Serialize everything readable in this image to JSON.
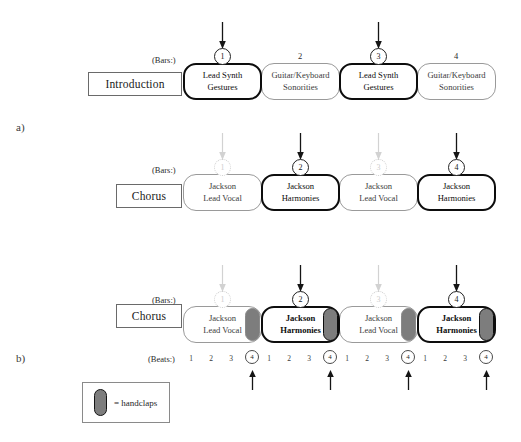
{
  "figure": {
    "sections": [
      {
        "letter": "a)",
        "rows": [
          {
            "name": "Introduction",
            "bars_label": "(Bars:)",
            "bars": [
              {
                "number": "1",
                "circled": true,
                "accent": true,
                "arrow": "black",
                "text": [
                  "Lead Synth",
                  "Gestures"
                ],
                "emphasis": "thick"
              },
              {
                "number": "2",
                "circled": false,
                "accent": false,
                "arrow": "none",
                "text": [
                  "Guitar/Keyboard",
                  "Sonorities"
                ],
                "emphasis": "thin"
              },
              {
                "number": "3",
                "circled": true,
                "accent": true,
                "arrow": "black",
                "text": [
                  "Lead Synth",
                  "Gestures"
                ],
                "emphasis": "thick"
              },
              {
                "number": "4",
                "circled": false,
                "accent": false,
                "arrow": "none",
                "text": [
                  "Guitar/Keyboard",
                  "Sonorities"
                ],
                "emphasis": "thin"
              }
            ]
          },
          {
            "name": "Chorus",
            "bars_label": "(Bars:)",
            "bars": [
              {
                "number": "1",
                "circled": false,
                "accent": false,
                "arrow": "gray",
                "text": [
                  "Jackson",
                  "Lead Vocal"
                ],
                "emphasis": "thin"
              },
              {
                "number": "2",
                "circled": true,
                "accent": true,
                "arrow": "black",
                "text": [
                  "Jackson",
                  "Harmonies"
                ],
                "emphasis": "thick"
              },
              {
                "number": "3",
                "circled": false,
                "accent": false,
                "arrow": "gray",
                "text": [
                  "Jackson",
                  "Lead Vocal"
                ],
                "emphasis": "thin"
              },
              {
                "number": "4",
                "circled": true,
                "accent": true,
                "arrow": "black",
                "text": [
                  "Jackson",
                  "Harmonies"
                ],
                "emphasis": "thick"
              }
            ]
          }
        ]
      },
      {
        "letter": "b)",
        "rows": [
          {
            "name": "Chorus",
            "bars_label": "(Bars:)",
            "beats_label": "(Beats:)",
            "beats": [
              "1",
              "2",
              "3",
              "4"
            ],
            "accented_beat": "4",
            "bars": [
              {
                "number": "1",
                "circled": false,
                "accent": false,
                "arrow": "gray",
                "text": [
                  "Jackson",
                  "Lead Vocal"
                ],
                "emphasis": "thin",
                "handclap": true
              },
              {
                "number": "2",
                "circled": true,
                "accent": true,
                "arrow": "black",
                "text": [
                  "Jackson",
                  "Harmonies"
                ],
                "emphasis": "thick",
                "handclap": true
              },
              {
                "number": "3",
                "circled": false,
                "accent": false,
                "arrow": "gray",
                "text": [
                  "Jackson",
                  "Lead Vocal"
                ],
                "emphasis": "thin",
                "handclap": true
              },
              {
                "number": "4",
                "circled": true,
                "accent": true,
                "arrow": "black",
                "text": [
                  "Jackson",
                  "Harmonies"
                ],
                "emphasis": "thick",
                "handclap": true
              }
            ]
          }
        ]
      }
    ],
    "legend": {
      "symbol": "handclap-pill",
      "text": "= handclaps"
    },
    "colors": {
      "accent_stroke": "#0d0d0d",
      "muted_stroke": "#9a9a9a",
      "faint": "#cdcdcd",
      "handclap_fill": "#7d7d7d",
      "background": "#ffffff"
    }
  }
}
